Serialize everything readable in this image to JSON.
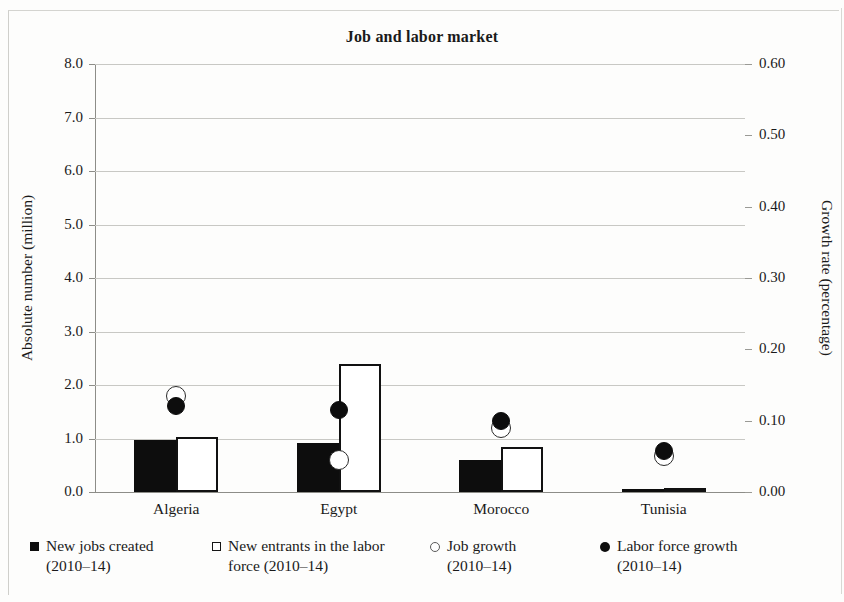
{
  "figure": {
    "title": "Job and labor market"
  },
  "axes": {
    "left": {
      "label": "Absolute number (million)",
      "ticks": [
        "0.0",
        "1.0",
        "2.0",
        "3.0",
        "4.0",
        "5.0",
        "6.0",
        "7.0",
        "8.0"
      ]
    },
    "right": {
      "label": "Growth rate (percentage)",
      "ticks": [
        "0.00",
        "0.10",
        "0.20",
        "0.30",
        "0.40",
        "0.50",
        "0.60"
      ]
    },
    "x": {
      "ticks": [
        "Algeria",
        "Egypt",
        "Morocco",
        "Tunisia"
      ]
    }
  },
  "legend": {
    "items": [
      {
        "marker": "filled-square",
        "label": "New jobs created\n(2010–14)"
      },
      {
        "marker": "open-square",
        "label": "New entrants in the labor\nforce (2010–14)"
      },
      {
        "marker": "open-circle",
        "label": "Job growth\n(2010–14)"
      },
      {
        "marker": "filled-circle",
        "label": "Labor force growth\n(2010–14)"
      }
    ]
  },
  "chart_data": {
    "type": "bar",
    "title": "Job and labor market",
    "xlabel": "",
    "ylabel": "Absolute number (million)",
    "y2label": "Growth rate (percentage)",
    "ylim": [
      0,
      8
    ],
    "y2lim": [
      0,
      0.6
    ],
    "grid": true,
    "legend_position": "bottom",
    "categories": [
      "Algeria",
      "Egypt",
      "Morocco",
      "Tunisia"
    ],
    "series": [
      {
        "name": "New jobs created (2010–14)",
        "type": "bar",
        "axis": "left",
        "style": "filled-black",
        "values": [
          0.97,
          0.91,
          0.6,
          0.06
        ]
      },
      {
        "name": "New entrants in the labor force (2010–14)",
        "type": "bar",
        "axis": "left",
        "style": "open-white",
        "values": [
          1.03,
          2.4,
          0.85,
          0.08
        ]
      },
      {
        "name": "Job growth (2010–14)",
        "type": "scatter",
        "axis": "right",
        "style": "open-circle",
        "values": [
          0.135,
          0.045,
          0.09,
          0.05
        ]
      },
      {
        "name": "Labor force growth (2010–14)",
        "type": "scatter",
        "axis": "right",
        "style": "filled-circle",
        "values": [
          0.12,
          0.115,
          0.1,
          0.058
        ]
      }
    ]
  }
}
